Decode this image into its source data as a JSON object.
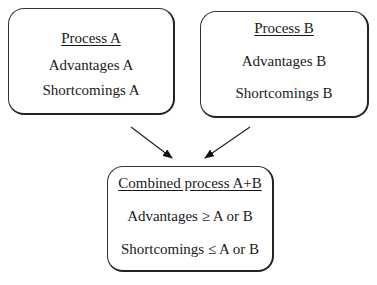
{
  "diagram": {
    "nodes": [
      {
        "id": "A",
        "title": "Process A",
        "lines": [
          "Advantages A",
          "Shortcomings A"
        ]
      },
      {
        "id": "B",
        "title": "Process B",
        "lines": [
          "Advantages B",
          "Shortcomings B"
        ]
      },
      {
        "id": "AB",
        "title": "Combined process A+B",
        "lines": [
          "Advantages ≥ A or B",
          "Shortcomings ≤ A or B"
        ]
      }
    ],
    "edges": [
      {
        "from": "A",
        "to": "AB"
      },
      {
        "from": "B",
        "to": "AB"
      }
    ]
  }
}
